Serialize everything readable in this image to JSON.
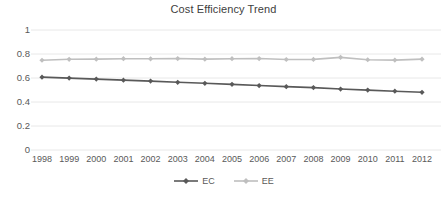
{
  "chart_data": {
    "type": "line",
    "title": "Cost Efficiency Trend",
    "xlabel": "",
    "ylabel": "",
    "categories": [
      "1998",
      "1999",
      "2000",
      "2001",
      "2002",
      "2003",
      "2004",
      "2005",
      "2006",
      "2007",
      "2008",
      "2009",
      "2010",
      "2011",
      "2012"
    ],
    "ylim": [
      0,
      1
    ],
    "yticks": [
      "0",
      "0.2",
      "0.4",
      "0.6",
      "0.8",
      "1"
    ],
    "ytick_values": [
      0,
      0.2,
      0.4,
      0.6,
      0.8,
      1
    ],
    "grid": "horizontal",
    "legend_position": "bottom-center",
    "series": [
      {
        "name": "EC",
        "color": "#595959",
        "marker": "diamond",
        "values": [
          0.607,
          0.599,
          0.591,
          0.582,
          0.574,
          0.564,
          0.556,
          0.547,
          0.537,
          0.528,
          0.52,
          0.508,
          0.499,
          0.49,
          0.481
        ]
      },
      {
        "name": "EE",
        "color": "#bfbfbf",
        "marker": "diamond",
        "values": [
          0.748,
          0.756,
          0.757,
          0.761,
          0.76,
          0.762,
          0.757,
          0.761,
          0.762,
          0.754,
          0.755,
          0.772,
          0.752,
          0.749,
          0.757
        ]
      }
    ]
  },
  "axes": {
    "gridline_color": "#e8e8e8",
    "tick_text_color": "#595959"
  },
  "legend": {
    "items": [
      {
        "label": "EC",
        "color": "#595959"
      },
      {
        "label": "EE",
        "color": "#bfbfbf"
      }
    ]
  }
}
